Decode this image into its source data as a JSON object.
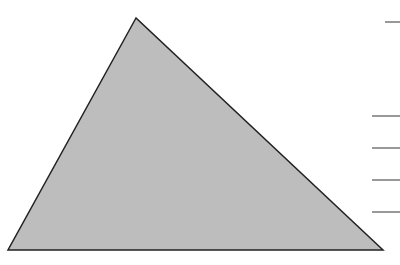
{
  "diagram": {
    "shape": "triangle",
    "vertices": [
      [
        136,
        18
      ],
      [
        8,
        250
      ],
      [
        383,
        250
      ]
    ],
    "fill": "#bdbdbd",
    "stroke": "#222222",
    "stroke_width": 1.5
  },
  "lines": [
    {
      "x1": 385,
      "y1": 22,
      "x2": 400,
      "y2": 22
    },
    {
      "x1": 372,
      "y1": 116,
      "x2": 400,
      "y2": 116
    },
    {
      "x1": 372,
      "y1": 148,
      "x2": 400,
      "y2": 148
    },
    {
      "x1": 372,
      "y1": 180,
      "x2": 400,
      "y2": 180
    },
    {
      "x1": 372,
      "y1": 212,
      "x2": 400,
      "y2": 212
    }
  ],
  "line_color": "#555555"
}
